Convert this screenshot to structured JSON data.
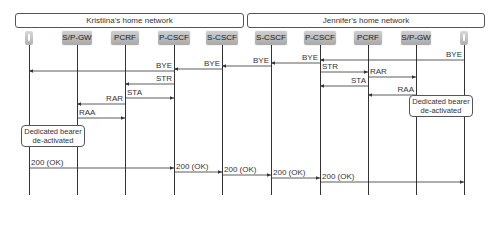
{
  "networks": {
    "left": "Kristiina's home network",
    "right": "Jennifer's home network"
  },
  "nodes": [
    {
      "id": "ue_k",
      "label": "",
      "type": "phone",
      "x": 29
    },
    {
      "id": "spgw_k",
      "label": "S/P-GW",
      "type": "box",
      "x": 77
    },
    {
      "id": "pcrf_k",
      "label": "PCRF",
      "type": "box",
      "x": 125
    },
    {
      "id": "pcscf_k",
      "label": "P-CSCF",
      "type": "box",
      "x": 174
    },
    {
      "id": "scscf_k",
      "label": "S-CSCF",
      "type": "box",
      "x": 222
    },
    {
      "id": "scscf_j",
      "label": "S-CSCF",
      "type": "box",
      "x": 271
    },
    {
      "id": "pcscf_j",
      "label": "P-CSCF",
      "type": "box",
      "x": 320
    },
    {
      "id": "pcrf_j",
      "label": "PCRF",
      "type": "box",
      "x": 368
    },
    {
      "id": "spgw_j",
      "label": "S/P-GW",
      "type": "box",
      "x": 416
    },
    {
      "id": "ue_j",
      "label": "",
      "type": "phone",
      "x": 464
    }
  ],
  "messages": [
    {
      "label": "BYE",
      "from": 464,
      "to": 320,
      "y": 60
    },
    {
      "label": "BYE",
      "from": 320,
      "to": 271,
      "y": 63
    },
    {
      "label": "BYE",
      "from": 271,
      "to": 222,
      "y": 66
    },
    {
      "label": "BYE",
      "from": 222,
      "to": 174,
      "y": 69
    },
    {
      "label": "BYE",
      "from": 174,
      "to": 29,
      "y": 71
    },
    {
      "label": "STR",
      "from": 320,
      "to": 368,
      "y": 72
    },
    {
      "label": "STR",
      "from": 174,
      "to": 125,
      "y": 84
    },
    {
      "label": "RAR",
      "from": 368,
      "to": 416,
      "y": 77
    },
    {
      "label": "STA",
      "from": 368,
      "to": 320,
      "y": 86
    },
    {
      "label": "RAA",
      "from": 416,
      "to": 368,
      "y": 95
    },
    {
      "label": "STA",
      "from": 125,
      "to": 174,
      "y": 98
    },
    {
      "label": "RAR",
      "from": 125,
      "to": 77,
      "y": 104
    },
    {
      "label": "RAA",
      "from": 77,
      "to": 125,
      "y": 118
    },
    {
      "label": "200 (OK)",
      "from": 29,
      "to": 174,
      "y": 168
    },
    {
      "label": "200 (OK)",
      "from": 174,
      "to": 222,
      "y": 172
    },
    {
      "label": "200 (OK)",
      "from": 222,
      "to": 271,
      "y": 175
    },
    {
      "label": "200 (OK)",
      "from": 271,
      "to": 320,
      "y": 178
    },
    {
      "label": "200 (OK)",
      "from": 320,
      "to": 464,
      "y": 182
    }
  ],
  "notes": {
    "left": {
      "line1": "Dedicated bearer",
      "line2": "de-activated"
    },
    "right": {
      "line1": "Dedicated bearer",
      "line2": "de-activated"
    }
  }
}
